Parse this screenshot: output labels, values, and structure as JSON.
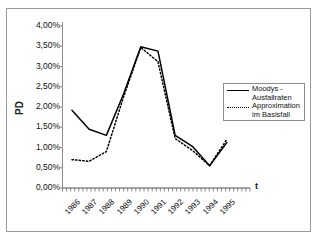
{
  "chart_data": {
    "type": "line",
    "title": "",
    "xlabel": "t",
    "ylabel": "PD",
    "categories": [
      "1986",
      "1987",
      "1988",
      "1989",
      "1990",
      "1991",
      "1992",
      "1993",
      "1994",
      "1995"
    ],
    "ytick_labels": [
      "4,00%",
      "3,50%",
      "3,00%",
      "2,50%",
      "2,00%",
      "1,50%",
      "1,00%",
      "0,50%",
      "0,00%"
    ],
    "ytick_values": [
      4.0,
      3.5,
      3.0,
      2.5,
      2.0,
      1.5,
      1.0,
      0.5,
      0.0
    ],
    "ylim": [
      0.0,
      4.0
    ],
    "grid": false,
    "legend_position": "right",
    "series": [
      {
        "name": "Moodys - Ausfallraten",
        "style": "solid",
        "color": "#000000",
        "values": [
          1.92,
          1.45,
          1.3,
          2.32,
          3.49,
          3.38,
          1.3,
          1.03,
          0.55,
          1.12
        ]
      },
      {
        "name": "Approximation im Basisfall",
        "style": "dotted",
        "color": "#000000",
        "values": [
          0.7,
          0.66,
          0.9,
          2.25,
          3.47,
          3.12,
          1.22,
          0.93,
          0.55,
          1.2
        ]
      }
    ]
  },
  "legend": {
    "items": [
      {
        "label": "Moodys -\nAusfallraten",
        "style": "solid"
      },
      {
        "label": "Approximation\nim Basisfall",
        "style": "dotted"
      }
    ]
  },
  "axes": {
    "y_axis_title": "PD",
    "x_axis_title": "t"
  }
}
